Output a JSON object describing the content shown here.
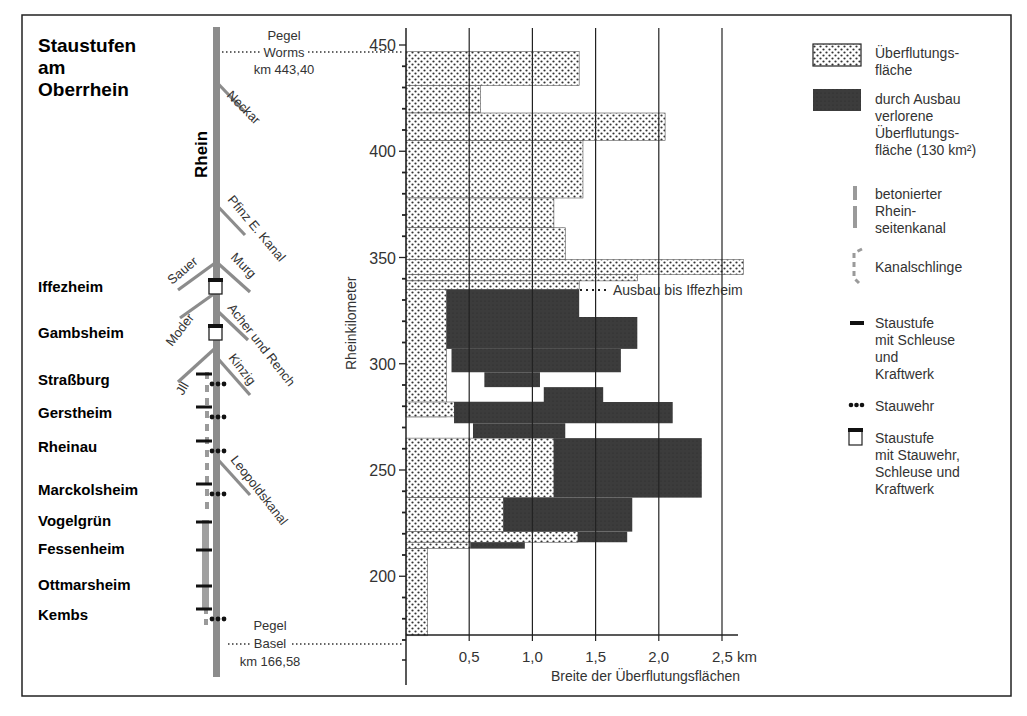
{
  "title_lines": [
    "Staustufen",
    "am",
    "Oberrhein"
  ],
  "river_label": "Rhein",
  "pegel_top": {
    "line1": "Pegel",
    "line2": "Worms",
    "line3": "km 443,40"
  },
  "pegel_bottom": {
    "line1": "Pegel",
    "line2": "Basel",
    "line3": "km 166,58"
  },
  "tributaries": [
    {
      "name": "Neckar",
      "side": "right"
    },
    {
      "name": "Pfinz E. Kanal",
      "side": "right"
    },
    {
      "name": "Sauer",
      "side": "left"
    },
    {
      "name": "Murg",
      "side": "right"
    },
    {
      "name": "Moder",
      "side": "left"
    },
    {
      "name": "Acher und Rench",
      "side": "right"
    },
    {
      "name": "Jll",
      "side": "left"
    },
    {
      "name": "Kinzig",
      "side": "right"
    },
    {
      "name": "Leopoldskanal",
      "side": "right"
    }
  ],
  "stations": [
    {
      "name": "Iffezheim",
      "type": "staustufe_wehr_schleuse_kraftwerk"
    },
    {
      "name": "Gambsheim",
      "type": "staustufe_wehr_schleuse_kraftwerk"
    },
    {
      "name": "Straßburg",
      "type": "staustufe_schleuse_kraftwerk+stauwehr"
    },
    {
      "name": "Gerstheim",
      "type": "staustufe_schleuse_kraftwerk+stauwehr"
    },
    {
      "name": "Rheinau",
      "type": "staustufe_schleuse_kraftwerk+stauwehr"
    },
    {
      "name": "Marckolsheim",
      "type": "staustufe_schleuse_kraftwerk+stauwehr"
    },
    {
      "name": "Vogelgrün",
      "type": "staustufe_schleuse_kraftwerk"
    },
    {
      "name": "Fessenheim",
      "type": "staustufe_schleuse_kraftwerk"
    },
    {
      "name": "Ottmarsheim",
      "type": "staustufe_schleuse_kraftwerk"
    },
    {
      "name": "Kembs",
      "type": "staustufe_schleuse_kraftwerk+stauwehr"
    }
  ],
  "annotation": "Ausbau bis Iffezheim",
  "legend": [
    {
      "key": "flood",
      "lines": [
        "Überflutungs-",
        "fläche"
      ]
    },
    {
      "key": "lost",
      "lines": [
        "durch Ausbau",
        "verlorene",
        "Überflutungs-",
        "fläche (130 km²)"
      ]
    },
    {
      "key": "canal",
      "lines": [
        "betonierter",
        "Rhein-",
        "seitenkanal"
      ]
    },
    {
      "key": "loop",
      "lines": [
        "Kanalschlinge"
      ]
    },
    {
      "key": "lock",
      "lines": [
        "Staustufe",
        "mit Schleuse",
        "und",
        "Kraftwerk"
      ]
    },
    {
      "key": "weir",
      "lines": [
        "Stauwehr"
      ]
    },
    {
      "key": "full",
      "lines": [
        "Staustufe",
        "mit Stauwehr,",
        "Schleuse und",
        "Kraftwerk"
      ]
    }
  ],
  "colors": {
    "river": "#8c8c8c",
    "lost": "#3a3a3a",
    "dot": "#2a2a2a",
    "axis": "#1a1a1a"
  },
  "chart_data": {
    "type": "bar",
    "orientation": "horizontal-step",
    "title": "Staustufen am Oberrhein",
    "xlabel": "Breite der Überflutungsflächen",
    "xunit": "km",
    "ylabel": "Rheinkilometer",
    "xlim": [
      0,
      2.6
    ],
    "ylim": [
      170,
      455
    ],
    "xticks": [
      0.5,
      1.0,
      1.5,
      2.0,
      2.5
    ],
    "xtick_labels": [
      "0,5",
      "1,0",
      "1,5",
      "2,0",
      "2,5 km"
    ],
    "yticks": [
      200,
      250,
      300,
      350,
      400,
      450
    ],
    "grid": "vertical",
    "series": [
      {
        "name": "Überflutungsfläche",
        "pattern": "dotted",
        "segments": [
          {
            "km_from": 431,
            "km_to": 447,
            "width": 1.37
          },
          {
            "km_from": 418,
            "km_to": 431,
            "width": 0.59
          },
          {
            "km_from": 405,
            "km_to": 418,
            "width": 2.05
          },
          {
            "km_from": 378,
            "km_to": 405,
            "width": 1.4
          },
          {
            "km_from": 364,
            "km_to": 378,
            "width": 1.17
          },
          {
            "km_from": 349,
            "km_to": 364,
            "width": 1.26
          },
          {
            "km_from": 342,
            "km_to": 349,
            "width": 2.67
          },
          {
            "km_from": 339,
            "km_to": 342,
            "width": 1.83
          },
          {
            "km_from": 335,
            "km_to": 339,
            "width": 1.37
          },
          {
            "km_from": 275,
            "km_to": 335,
            "width": 0.32
          },
          {
            "km_from": 275,
            "km_to": 282,
            "width": 1.09
          },
          {
            "km_from": 237,
            "km_to": 265,
            "width": 1.17
          },
          {
            "km_from": 221,
            "km_to": 237,
            "width": 0.77
          },
          {
            "km_from": 216,
            "km_to": 221,
            "width": 1.36
          },
          {
            "km_from": 213,
            "km_to": 216,
            "width": 0.51
          },
          {
            "km_from": 172,
            "km_to": 213,
            "width": 0.17
          }
        ]
      },
      {
        "name": "durch Ausbau verlorene Überflutungsfläche (130 km²)",
        "pattern": "dark",
        "segments": [
          {
            "km_from": 322,
            "km_to": 335,
            "x0": 0.32,
            "x1": 1.37
          },
          {
            "km_from": 307,
            "km_to": 322,
            "x0": 0.32,
            "x1": 1.83
          },
          {
            "km_from": 296,
            "km_to": 307,
            "x0": 0.36,
            "x1": 1.7
          },
          {
            "km_from": 289,
            "km_to": 296,
            "x0": 0.62,
            "x1": 1.06
          },
          {
            "km_from": 282,
            "km_to": 289,
            "x0": 1.09,
            "x1": 1.56
          },
          {
            "km_from": 272,
            "km_to": 282,
            "x0": 0.38,
            "x1": 2.11
          },
          {
            "km_from": 265,
            "km_to": 272,
            "x0": 0.53,
            "x1": 1.26
          },
          {
            "km_from": 237,
            "km_to": 265,
            "x0": 1.17,
            "x1": 2.34
          },
          {
            "km_from": 221,
            "km_to": 237,
            "x0": 0.77,
            "x1": 1.79
          },
          {
            "km_from": 216,
            "km_to": 221,
            "x0": 1.36,
            "x1": 1.75
          },
          {
            "km_from": 213,
            "km_to": 216,
            "x0": 0.51,
            "x1": 0.94
          }
        ]
      }
    ],
    "annotations": [
      "Ausbau bis Iffezheim",
      "Pegel Worms km 443,40",
      "Pegel Basel km 166,58"
    ]
  }
}
